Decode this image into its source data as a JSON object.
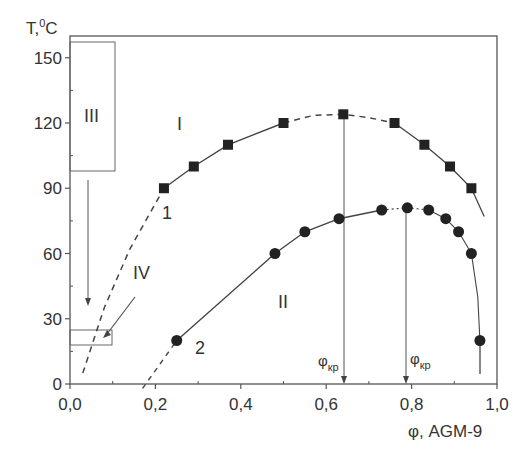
{
  "chart_data": {
    "type": "line",
    "title": "",
    "xlabel": "φ, AGM-9",
    "ylabel": "T,⁰C",
    "xlim": [
      0,
      1.0
    ],
    "ylim": [
      0,
      160
    ],
    "xticks": [
      "0,0",
      "0,2",
      "0,4",
      "0,6",
      "0,8",
      "1,0"
    ],
    "xtick_values": [
      0,
      0.2,
      0.4,
      0.6,
      0.8,
      1.0
    ],
    "yticks": [
      "0",
      "30",
      "60",
      "90",
      "120",
      "150"
    ],
    "ytick_values": [
      0,
      30,
      60,
      90,
      120,
      150
    ],
    "grid": false,
    "series": [
      {
        "name": "1",
        "marker": "square",
        "x": [
          0.22,
          0.29,
          0.37,
          0.5,
          0.64,
          0.76,
          0.83,
          0.89,
          0.94
        ],
        "y": [
          90,
          100,
          110,
          120,
          124,
          120,
          110,
          100,
          90
        ]
      },
      {
        "name": "2",
        "marker": "circle",
        "x": [
          0.25,
          0.48,
          0.55,
          0.63,
          0.73,
          0.79,
          0.84,
          0.88,
          0.91,
          0.94,
          0.96
        ],
        "y": [
          20,
          60,
          70,
          76,
          80,
          81,
          80,
          76,
          70,
          60,
          20
        ]
      }
    ],
    "annotations": [
      {
        "text": "I",
        "x": 0.26,
        "y": 120
      },
      {
        "text": "II",
        "x": 0.5,
        "y": 37
      },
      {
        "text": "III",
        "x": 0.07,
        "y": 120
      },
      {
        "text": "IV",
        "x": 0.17,
        "y": 48
      },
      {
        "text": "1",
        "x": 0.22,
        "y": 75
      },
      {
        "text": "2",
        "x": 0.31,
        "y": 18
      },
      {
        "text": "φкр",
        "x": 0.64,
        "y": 10
      },
      {
        "text": "φкр",
        "x": 0.79,
        "y": 10
      }
    ],
    "critical_points": [
      0.64,
      0.79
    ]
  },
  "labels": {
    "y_axis_title": "T,",
    "y_axis_unit": "C",
    "y_axis_sup": "0",
    "x_axis_title": "φ, AGM-9",
    "region_I": "I",
    "region_II": "II",
    "region_III": "III",
    "region_IV": "IV",
    "curve_1": "1",
    "curve_2": "2",
    "phi_cr_1": "φ",
    "phi_cr_1_sub": "кр",
    "phi_cr_2": "φ",
    "phi_cr_2_sub": "кр"
  }
}
